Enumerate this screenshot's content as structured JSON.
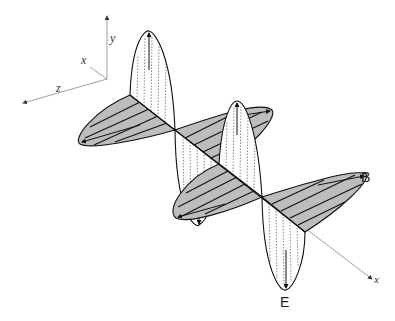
{
  "axes": {
    "y_label": "y",
    "x_label_small": "x",
    "z_label": "z",
    "x_label_prop": "x"
  },
  "fields": {
    "magnetic_label": "B",
    "electric_label": "E"
  },
  "colors": {
    "b_fill": "#bdbdbd",
    "line": "#1a1a1a",
    "axis": "#888888"
  }
}
